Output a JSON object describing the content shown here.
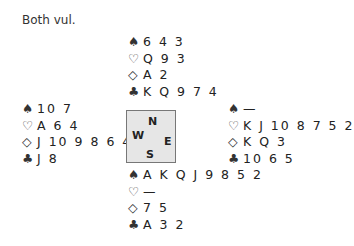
{
  "vulnerability": "Both vul.",
  "suits": {
    "spades": "♠",
    "hearts": "♡",
    "diamonds": "◇",
    "clubs": "♣"
  },
  "compass": {
    "n": "N",
    "w": "W",
    "e": "E",
    "s": "S",
    "bg": "#e6e6e6"
  },
  "hands": {
    "north": {
      "spades": "6 4 3",
      "hearts": "Q 9 3",
      "diamonds": "A 2",
      "clubs": "K Q 9 7 4"
    },
    "west": {
      "spades": "10 7",
      "hearts": "A 6 4",
      "diamonds": "J 10 9 8 6 4",
      "clubs": "J 8"
    },
    "east": {
      "spades": "—",
      "hearts": "K J 10 8 7 5 2",
      "diamonds": "K Q 3",
      "clubs": "10 6 5"
    },
    "south": {
      "spades": "A K Q J 9 8 5 2",
      "hearts": "—",
      "diamonds": "7 5",
      "clubs": "A 3 2"
    }
  }
}
